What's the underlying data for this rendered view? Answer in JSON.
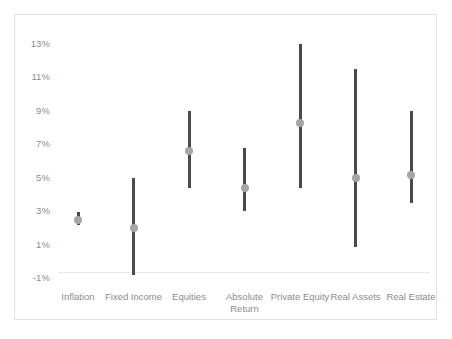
{
  "chart_data": {
    "type": "bar",
    "title": "",
    "subtitle": "",
    "xlabel": "",
    "ylabel": "",
    "grid": false,
    "legend": "none",
    "ylim": [
      -1,
      13
    ],
    "ytick_labels": [
      "13%",
      "11%",
      "9%",
      "7%",
      "5%",
      "3%",
      "1%",
      "-1%"
    ],
    "ytick_values": [
      13,
      11,
      9,
      7,
      5,
      3,
      1,
      -1
    ],
    "categories": [
      "Inflation",
      "Fixed Income",
      "Equities",
      "Absolute\nReturn",
      "Private Equity",
      "Real Assets",
      "Real Estate"
    ],
    "series": [
      {
        "name": "High",
        "values": [
          3.0,
          5.0,
          9.0,
          6.8,
          13.0,
          11.5,
          9.0
        ]
      },
      {
        "name": "Expected",
        "values": [
          2.5,
          2.0,
          6.6,
          4.4,
          8.3,
          5.0,
          5.2
        ]
      },
      {
        "name": "Low",
        "values": [
          2.2,
          -0.8,
          4.4,
          3.0,
          4.4,
          0.9,
          3.5
        ]
      }
    ],
    "colors": {
      "range_bar": "#4a4a4a",
      "marker": "#a6a6a6",
      "axis_line": "#e8e8e8",
      "frame_border": "#e2e2e2",
      "tick_text": "#8c8c8c",
      "background": "#ffffff"
    }
  },
  "axis": {
    "y_labels": [
      "13%",
      "11%",
      "9%",
      "7%",
      "5%",
      "3%",
      "1%",
      "-1%"
    ],
    "x_labels": [
      "Inflation",
      "Fixed Income",
      "Equities",
      "Absolute\nReturn",
      "Private Equity",
      "Real Assets",
      "Real Estate"
    ]
  }
}
